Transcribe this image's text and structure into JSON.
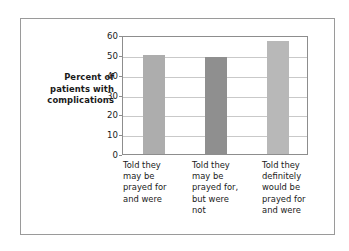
{
  "chart_data": {
    "type": "bar",
    "title": "",
    "subtitle": "",
    "xlabel": "",
    "ylabel": "Percent of patients with complications",
    "ylabel_lines": [
      "Percent of",
      "patients with",
      "complications"
    ],
    "categories": [
      "Told they may be prayed for and were",
      "Told they may be prayed for, but were not",
      "Told they definitely would be prayed for and were"
    ],
    "category_lines": [
      [
        "Told they",
        "may be",
        "prayed for",
        "and were"
      ],
      [
        "Told they",
        "may be",
        "prayed for,",
        "but were",
        "not"
      ],
      [
        "Told they",
        "definitely",
        "would be",
        "prayed for",
        "and were"
      ]
    ],
    "values": [
      50,
      49,
      57
    ],
    "ylim": [
      0,
      60
    ],
    "ytick_labels": [
      "60",
      "50",
      "40",
      "30",
      "20",
      "10",
      "0"
    ],
    "yticks": [
      60,
      50,
      40,
      30,
      20,
      10,
      0
    ],
    "grid": true,
    "legend": "none",
    "bar_colors": [
      "#adadad",
      "#8f8f8f",
      "#b8b8b8"
    ],
    "plot_border_color": "#8d8d8d",
    "gridline_color": "#c9c9c9",
    "frame_color": "#9a9a9a",
    "background_color": "#ffffff",
    "text_color": "#1a1a1a"
  }
}
